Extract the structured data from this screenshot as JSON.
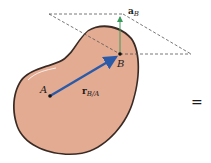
{
  "diagram": {
    "labels": {
      "point_a": "A",
      "point_b": "B",
      "accel_vector": {
        "main": "a",
        "sub": "B"
      },
      "position_vector": {
        "main": "r",
        "sub": "B/A"
      },
      "equals": "="
    },
    "colors": {
      "body_fill": "#e3ab92",
      "body_outline": "#3a2a24",
      "position_vector": "#2a5aa8",
      "accel_vector": "#3a9a5a",
      "dashed_plane": "#555555",
      "point": "#111111"
    }
  }
}
